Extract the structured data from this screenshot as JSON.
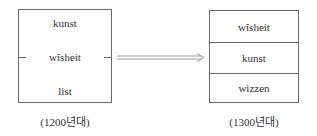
{
  "left": {
    "words": [
      "kunst",
      "wîsheit",
      "list"
    ],
    "caption": "(1200년대)"
  },
  "right": {
    "words": [
      "wîsheit",
      "kunst",
      "wizzen"
    ],
    "caption": "(1300년대)"
  },
  "arrow": {
    "icon": "double-arrow-right-icon",
    "color": "#9a9a9a"
  }
}
